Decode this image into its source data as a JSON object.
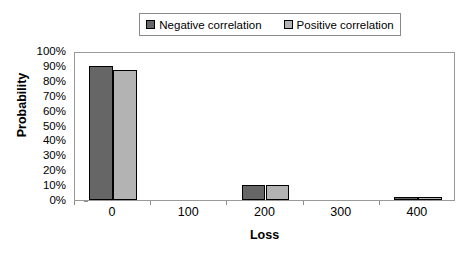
{
  "legend": {
    "position": "top-center",
    "entries": [
      {
        "label": "Negative correlation",
        "color": "#666666",
        "swatch_name": "legend-swatch-negative"
      },
      {
        "label": "Positive correlation",
        "color": "#b3b3b3",
        "swatch_name": "legend-swatch-positive"
      }
    ]
  },
  "axes": {
    "y_title": "Probability",
    "x_title": "Loss",
    "y_ticks": [
      "100%",
      "90%",
      "80%",
      "70%",
      "60%",
      "50%",
      "40%",
      "30%",
      "20%",
      "10%",
      "0%"
    ],
    "x_ticks": [
      "0",
      "100",
      "200",
      "300",
      "400"
    ]
  },
  "chart_data": {
    "type": "bar",
    "title": "",
    "subtitle": "",
    "xlabel": "Loss",
    "ylabel": "Probability",
    "categories": [
      "0",
      "100",
      "200",
      "300",
      "400"
    ],
    "series": [
      {
        "name": "Negative correlation",
        "color": "#666666",
        "values": [
          90,
          0,
          10,
          0,
          2
        ]
      },
      {
        "name": "Positive correlation",
        "color": "#b3b3b3",
        "values": [
          87,
          0,
          10,
          0,
          2
        ]
      }
    ],
    "ylim": [
      0,
      100
    ],
    "y_tick_step": 10,
    "y_unit": "%",
    "grid": false,
    "legend": "top-center",
    "annotations": []
  }
}
